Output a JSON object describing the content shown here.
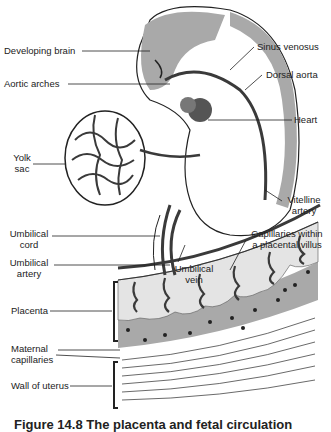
{
  "figure": {
    "labels": {
      "developing_brain": "Developing brain",
      "aortic_arches": "Aortic arches",
      "yolk_sac_1": "Yolk",
      "yolk_sac_2": "sac",
      "umbilical_cord_1": "Umbilical",
      "umbilical_cord_2": "cord",
      "umbilical_artery_1": "Umbilical",
      "umbilical_artery_2": "artery",
      "placenta": "Placenta",
      "maternal_capillaries_1": "Maternal",
      "maternal_capillaries_2": "capillaries",
      "wall_of_uterus": "Wall of uterus",
      "sinus_venosus": "Sinus venosus",
      "dorsal_aorta": "Dorsal aorta",
      "heart": "Heart",
      "vitelline_artery_1": "Vitelline",
      "vitelline_artery_2": "artery",
      "capillaries_villus_1": "Capillaries within",
      "capillaries_villus_2": "a placental villus",
      "umbilical_vein_1": "Umbilical",
      "umbilical_vein_2": "vein"
    },
    "caption_partial": "Figure 14.8  The placenta and fetal circulation",
    "colors": {
      "tissue_gray": "#a9a9a9",
      "vessel_dark": "#3a3a3a",
      "line": "#222222",
      "stipple": "#e4e4e4"
    }
  }
}
